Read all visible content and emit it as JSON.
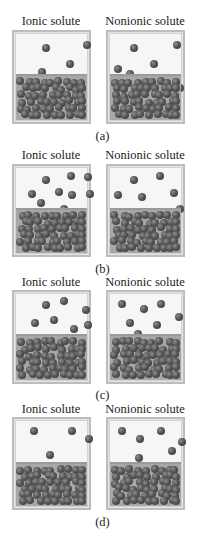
{
  "figure": {
    "panels": [
      {
        "id": "a",
        "label": "(a)",
        "containers": [
          {
            "title": "Ionic solute",
            "vapor_particles": 4
          },
          {
            "title": "Nonionic solute",
            "vapor_particles": 6
          }
        ]
      },
      {
        "id": "b",
        "label": "(b)",
        "containers": [
          {
            "title": "Ionic solute",
            "vapor_particles": 9
          },
          {
            "title": "Nonionic solute",
            "vapor_particles": 6
          }
        ]
      },
      {
        "id": "c",
        "label": "(c)",
        "containers": [
          {
            "title": "Ionic solute",
            "vapor_particles": 7
          },
          {
            "title": "Nonionic solute",
            "vapor_particles": 7
          }
        ]
      },
      {
        "id": "d",
        "label": "(d)",
        "containers": [
          {
            "title": "Ionic solute",
            "vapor_particles": 4
          },
          {
            "title": "Nonionic solute",
            "vapor_particles": 6
          }
        ]
      }
    ],
    "colors": {
      "border": "#bdbdbd",
      "vapor": "#f6f6f6",
      "liquid": "#a7a7a7",
      "particle": "#444444"
    }
  }
}
